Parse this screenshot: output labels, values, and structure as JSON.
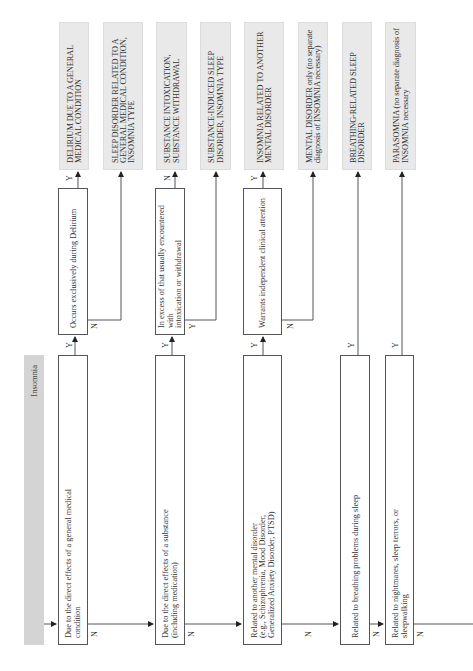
{
  "flowchart": {
    "start": {
      "label": "Insomnia"
    },
    "decisions": [
      {
        "id": "d1",
        "text": "Due to the direct effects of a general medical\ncondition"
      },
      {
        "id": "d1b",
        "text": "Occurs exclusively during Delirium"
      },
      {
        "id": "d2",
        "text": "Due to the direct effects of a substance\n(including medication)"
      },
      {
        "id": "d2b",
        "text": "In excess of that usually encountered with\nintoxication or withdrawal"
      },
      {
        "id": "d3",
        "text": "Related to another mental disorder\n(e.g., Schizophrenia, Mood Disorder,\nGeneralized Anxiety Disorder, PTSD)"
      },
      {
        "id": "d3b",
        "text": "Warrants independent clinical attention"
      },
      {
        "id": "d4",
        "text": "Related to breathing problems during sleep"
      },
      {
        "id": "d5",
        "text": "Related to nightmares, sleep terrors, or\nsleepwalking"
      }
    ],
    "outcomes": [
      {
        "id": "o1",
        "text": "DELIRIUM DUE TO A GENERAL\nMEDICAL CONDITION"
      },
      {
        "id": "o2",
        "text": "SLEEP DISORDER RELATED TO A\nGENERAL MEDICAL CONDITION,\nINSOMNIA TYPE"
      },
      {
        "id": "o3",
        "text": "SUBSTANCE INTOXICATION,\nSUBSTANCE WITHDRAWAL"
      },
      {
        "id": "o4",
        "text": "SUBSTANCE-INDUCED SLEEP\nDISORDER, INSOMNIA TYPE"
      },
      {
        "id": "o5",
        "text": "INSOMNIA RELATED TO ANOTHER\nMENTAL DISORDER"
      },
      {
        "id": "o6",
        "text": "MENTAL DISORDER only (no separate\ndiagnosis of INSOMNIA necessary)"
      },
      {
        "id": "o7",
        "text": "BREATHING-RELATED SLEEP\nDISORDER"
      },
      {
        "id": "o8",
        "text": "PARASOMNIA (no separate diagnosis of\nINSOMNIA necessary"
      }
    ],
    "branch_labels": {
      "yes": "Y",
      "no": "N"
    }
  },
  "colors": {
    "outcome_fill": "#e9e9e9",
    "start_fill": "#d4d4d4",
    "line": "#555555"
  }
}
